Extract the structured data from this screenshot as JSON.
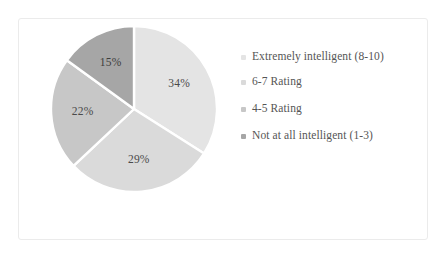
{
  "chart_data": {
    "type": "pie",
    "title": "",
    "subtitle": "",
    "xlabel": "",
    "ylabel": "",
    "legend_position": "right",
    "grid": false,
    "units": "percent",
    "categories": [
      "Extremely intelligent (8-10)",
      "6-7 Rating",
      "4-5 Rating",
      "Not at all intelligent (1-3)"
    ],
    "values": [
      34,
      29,
      22,
      15
    ],
    "data_labels": [
      "34%",
      "29%",
      "22%",
      "15%"
    ],
    "colors": [
      "#e4e4e4",
      "#dadada",
      "#c7c7c7",
      "#a6a6a6"
    ],
    "slices": [
      {
        "label": "Extremely intelligent (8-10)",
        "value": 34,
        "data_label": "34%",
        "color": "#e4e4e4"
      },
      {
        "label": "6-7 Rating",
        "value": 29,
        "data_label": "29%",
        "color": "#dadada"
      },
      {
        "label": "4-5 Rating",
        "value": 22,
        "data_label": "22%",
        "color": "#c7c7c7"
      },
      {
        "label": "Not at all intelligent (1-3)",
        "value": 15,
        "data_label": "15%",
        "color": "#a6a6a6"
      }
    ]
  },
  "legend": {
    "items": [
      {
        "label": "Extremely intelligent (8-10)",
        "color": "#e4e4e4"
      },
      {
        "label": "6-7 Rating",
        "color": "#dadada"
      },
      {
        "label": "4-5 Rating",
        "color": "#c7c7c7"
      },
      {
        "label": "Not at all intelligent (1-3)",
        "color": "#a6a6a6"
      }
    ]
  },
  "style": {
    "border_color": "#ebebeb",
    "background": "#ffffff",
    "separator_color": "#ffffff",
    "label_color": "#4a4a4a"
  }
}
